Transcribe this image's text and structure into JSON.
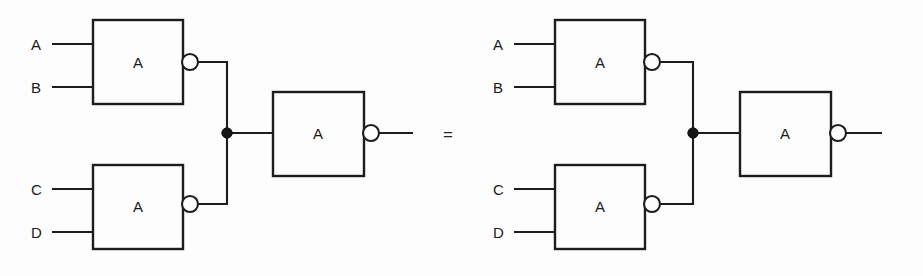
{
  "figure": {
    "kind": "logic-gate-equivalence-diagram",
    "background_color": "#fdfdfd",
    "line_color": "#1d1d1d",
    "relation_symbol": "=",
    "width": 923,
    "height": 276
  },
  "circuits": [
    {
      "id": "left-circuit",
      "name": "left-circuit",
      "x_offset": 0,
      "inputs": [
        {
          "label": "A",
          "x": 37,
          "y": 48
        },
        {
          "label": "B",
          "x": 37,
          "y": 91
        },
        {
          "label": "C",
          "x": 37,
          "y": 193
        },
        {
          "label": "D",
          "x": 37,
          "y": 236
        }
      ],
      "gates": [
        {
          "id": "gate-ab",
          "name": "nand-gate-ab",
          "label": "A",
          "box": {
            "x": 93,
            "y": 20,
            "w": 90,
            "h": 84
          },
          "bubble": {
            "cx": 190,
            "cy": 62,
            "r": 8
          },
          "input_pins_y": [
            44,
            87
          ]
        },
        {
          "id": "gate-cd",
          "name": "nand-gate-cd",
          "label": "A",
          "box": {
            "x": 93,
            "y": 165,
            "w": 90,
            "h": 84
          },
          "bubble": {
            "cx": 190,
            "cy": 204,
            "r": 8
          },
          "input_pins_y": [
            189,
            232
          ]
        },
        {
          "id": "gate-out",
          "name": "nand-gate-output",
          "label": "A",
          "box": {
            "x": 273,
            "y": 92,
            "w": 91,
            "h": 84
          },
          "bubble": {
            "cx": 371,
            "cy": 133,
            "r": 8
          },
          "input_pins_y": [
            133
          ]
        }
      ],
      "junction": {
        "cx": 227,
        "cy": 133,
        "r": 5.2
      },
      "output_wire": {
        "x1": 379,
        "y1": 133,
        "x2": 413,
        "y2": 133
      }
    },
    {
      "id": "right-circuit",
      "name": "right-circuit",
      "x_offset": 462,
      "inputs": [
        {
          "label": "A",
          "x": 499,
          "y": 48
        },
        {
          "label": "B",
          "x": 499,
          "y": 91
        },
        {
          "label": "C",
          "x": 499,
          "y": 193
        },
        {
          "label": "D",
          "x": 499,
          "y": 236
        }
      ],
      "gates": [
        {
          "id": "gate-ab-r",
          "name": "nand-gate-ab",
          "label": "A",
          "box": {
            "x": 555,
            "y": 20,
            "w": 90,
            "h": 84
          },
          "bubble": {
            "cx": 652,
            "cy": 62,
            "r": 8
          },
          "input_pins_y": [
            44,
            87
          ]
        },
        {
          "id": "gate-cd-r",
          "name": "nand-gate-cd",
          "label": "A",
          "box": {
            "x": 555,
            "y": 165,
            "w": 90,
            "h": 84
          },
          "bubble": {
            "cx": 652,
            "cy": 204,
            "r": 8
          },
          "input_pins_y": [
            189,
            232
          ]
        },
        {
          "id": "gate-out-r",
          "name": "nand-gate-output",
          "label": "A",
          "box": {
            "x": 740,
            "y": 92,
            "w": 91,
            "h": 84
          },
          "bubble": {
            "cx": 838,
            "cy": 133,
            "r": 8
          },
          "input_pins_y": [
            133
          ]
        }
      ],
      "junction": {
        "cx": 693,
        "cy": 133,
        "r": 5.2
      },
      "output_wire": {
        "x1": 846,
        "y1": 133,
        "x2": 882,
        "y2": 133
      }
    }
  ],
  "relation": {
    "symbol": "=",
    "x": 448,
    "y": 140
  }
}
